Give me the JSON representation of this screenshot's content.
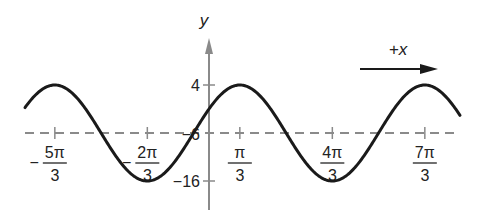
{
  "chart_data": {
    "type": "line",
    "title": "",
    "function": "y = -6 + 10 cos(x - π/3)",
    "xlabel": "",
    "ylabel": "y",
    "direction_label": "+x",
    "x_ticks": [
      {
        "value": -1.6667,
        "numer": "5π",
        "denom": "3",
        "sign": "−"
      },
      {
        "value": -0.6667,
        "numer": "2π",
        "denom": "3",
        "sign": "−"
      },
      {
        "value": 0.3333,
        "numer": "π",
        "denom": "3",
        "sign": ""
      },
      {
        "value": 1.3333,
        "numer": "4π",
        "denom": "3",
        "sign": ""
      },
      {
        "value": 2.3333,
        "numer": "7π",
        "denom": "3",
        "sign": ""
      }
    ],
    "x_units": "multiples of π",
    "y_ticks": [
      {
        "value": 4,
        "label": "4"
      },
      {
        "value": -6,
        "label": "−6"
      },
      {
        "value": -16,
        "label": "−16"
      }
    ],
    "midline": {
      "value": -6,
      "style": "dashed"
    },
    "series": [
      {
        "name": "wave",
        "amplitude": 10,
        "midline": -6,
        "period": "2π",
        "phase_shift": "π/3",
        "maxima_x": [
          "-5π/3",
          "π/3",
          "7π/3"
        ],
        "minima_x": [
          "-2π/3",
          "4π/3"
        ],
        "max_value": 4,
        "min_value": -16
      }
    ],
    "xlim_pi": [
      -1.98,
      2.72
    ],
    "ylim": [
      -22,
      16
    ],
    "grid": false,
    "legend": "none"
  },
  "colors": {
    "curve": "#1a1a1a",
    "axis": "#8a8a8a",
    "dashed": "#8a8a8a",
    "text": "#222222"
  }
}
